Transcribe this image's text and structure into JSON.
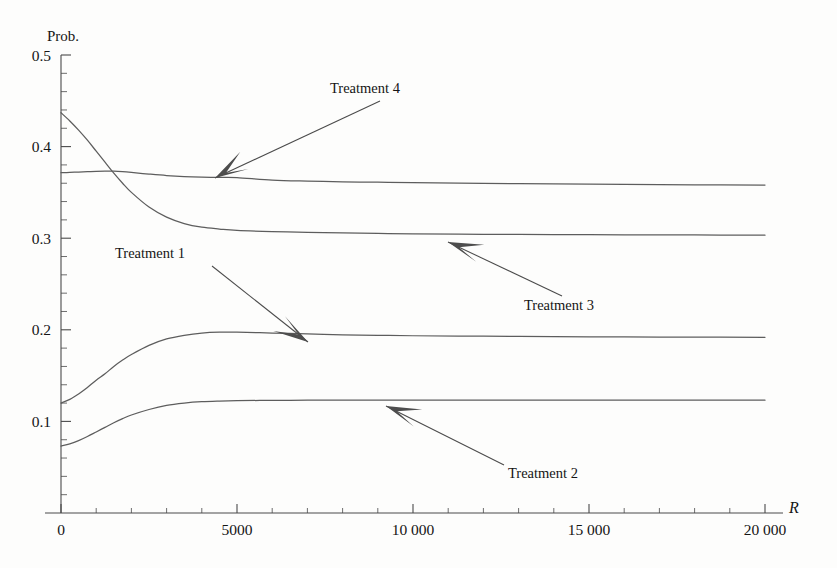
{
  "chart_data": {
    "type": "line",
    "title": "",
    "subtitle": "",
    "xlabel": "R",
    "ylabel": "Prob.",
    "xlim": [
      0,
      20000
    ],
    "ylim": [
      0,
      0.5
    ],
    "grid": false,
    "legend_position": "inline-annotations",
    "x_ticks": [
      {
        "value": 0,
        "label": "0"
      },
      {
        "value": 5000,
        "label": "5000"
      },
      {
        "value": 10000,
        "label": "10 000"
      },
      {
        "value": 15000,
        "label": "15 000"
      },
      {
        "value": 20000,
        "label": "20 000"
      }
    ],
    "x_minor_step": 1000,
    "y_ticks": [
      {
        "value": 0.1,
        "label": "0.1"
      },
      {
        "value": 0.2,
        "label": "0.2"
      },
      {
        "value": 0.3,
        "label": "0.3"
      },
      {
        "value": 0.4,
        "label": "0.4"
      },
      {
        "value": 0.5,
        "label": "0.5"
      }
    ],
    "y_minor_step": 0.02,
    "x": [
      0,
      250,
      500,
      750,
      1000,
      1250,
      1500,
      1750,
      2000,
      2500,
      3000,
      3500,
      4000,
      4500,
      5000,
      6000,
      7000,
      8000,
      9000,
      10000,
      12000,
      14000,
      16000,
      18000,
      20000
    ],
    "series": [
      {
        "name": "Treatment 1",
        "color": "#5d5d5d",
        "values": [
          0.12,
          0.124,
          0.13,
          0.137,
          0.145,
          0.152,
          0.16,
          0.167,
          0.173,
          0.183,
          0.19,
          0.194,
          0.1965,
          0.1975,
          0.1975,
          0.1965,
          0.1955,
          0.1945,
          0.194,
          0.1935,
          0.193,
          0.1925,
          0.1922,
          0.192,
          0.1918
        ]
      },
      {
        "name": "Treatment 2",
        "color": "#5d5d5d",
        "values": [
          0.073,
          0.0755,
          0.079,
          0.0835,
          0.0885,
          0.0935,
          0.0985,
          0.103,
          0.107,
          0.113,
          0.1175,
          0.12,
          0.1215,
          0.1222,
          0.1226,
          0.123,
          0.1231,
          0.1232,
          0.1232,
          0.1233,
          0.1233,
          0.1233,
          0.1232,
          0.1232,
          0.1232
        ]
      },
      {
        "name": "Treatment 3",
        "color": "#5d5d5d",
        "values": [
          0.437,
          0.428,
          0.418,
          0.407,
          0.395,
          0.383,
          0.371,
          0.36,
          0.35,
          0.334,
          0.323,
          0.316,
          0.312,
          0.31,
          0.3085,
          0.3072,
          0.3063,
          0.3057,
          0.3052,
          0.3048,
          0.3043,
          0.304,
          0.3037,
          0.3035,
          0.3033
        ]
      },
      {
        "name": "Treatment 4",
        "color": "#5d5d5d",
        "values": [
          0.3715,
          0.3718,
          0.3722,
          0.3726,
          0.373,
          0.3732,
          0.3731,
          0.3726,
          0.3718,
          0.37,
          0.3684,
          0.3673,
          0.3667,
          0.3664,
          0.3662,
          0.3634,
          0.3623,
          0.3616,
          0.3611,
          0.3606,
          0.3598,
          0.3592,
          0.3587,
          0.3583,
          0.358
        ]
      }
    ],
    "annotations": [
      {
        "label": "Treatment 1",
        "text_x": 115,
        "text_y": 258,
        "line_from_x": 212,
        "line_from_y": 266,
        "line_to_x": 308,
        "line_to_y": 342,
        "arrow_angle_deg": 38
      },
      {
        "label": "Treatment 2",
        "text_x": 508,
        "text_y": 478,
        "line_from_x": 504,
        "line_from_y": 465,
        "line_to_x": 386,
        "line_to_y": 406,
        "arrow_angle_deg": 206
      },
      {
        "label": "Treatment 3",
        "text_x": 524,
        "text_y": 310,
        "line_from_x": 562,
        "line_from_y": 296,
        "line_to_x": 448,
        "line_to_y": 242,
        "arrow_angle_deg": 205
      },
      {
        "label": "Treatment 4",
        "text_x": 330,
        "text_y": 93,
        "line_from_x": 380,
        "line_from_y": 101,
        "line_to_x": 215,
        "line_to_y": 178,
        "arrow_angle_deg": 205
      }
    ]
  },
  "axis": {
    "y_label": "Prob.",
    "x_label": "R"
  },
  "geometry": {
    "x0_px": 61,
    "x1_px": 765,
    "y0_px": 513,
    "y_top_px": 55
  }
}
